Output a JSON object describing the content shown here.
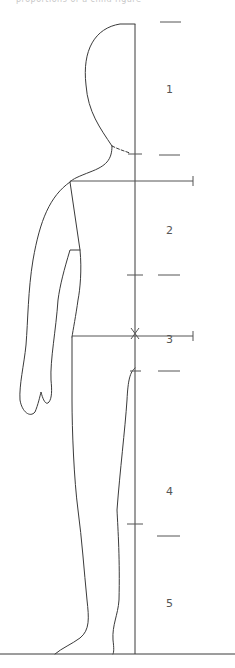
{
  "caption": "proportions of a child figure",
  "figure": {
    "segments": [
      {
        "id": 1,
        "label": "1",
        "name": "head"
      },
      {
        "id": 2,
        "label": "2",
        "name": "upper-torso"
      },
      {
        "id": 3,
        "label": "3",
        "name": "lower-torso"
      },
      {
        "id": 4,
        "label": "4",
        "name": "thigh"
      },
      {
        "id": 5,
        "label": "5",
        "name": "lower-leg"
      }
    ],
    "markers": {
      "center_mark": "×"
    }
  }
}
